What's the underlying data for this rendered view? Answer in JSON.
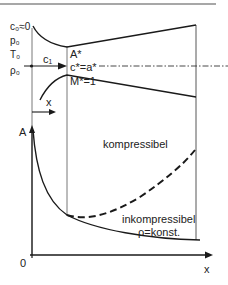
{
  "diagram": {
    "stagnation_labels": [
      "c₀≈0",
      "p₀",
      "T₀",
      "ρ₀"
    ],
    "inflow_velocity_label": "c₁",
    "throat_labels": [
      "A*",
      "c*=a*",
      "M*=1"
    ],
    "x_arrow_label": "x",
    "chart": {
      "y_axis_label": "A",
      "x_axis_label": "x",
      "origin_label": "0",
      "curve_compressible_label": "kompressibel",
      "curve_incompressible_label_1": "inkompressibel",
      "curve_incompressible_label_2": "ρ=konst."
    },
    "colors": {
      "line": "#1a1a1a",
      "thin_line": "#555555",
      "top_rule": "#8a8a8a"
    }
  }
}
